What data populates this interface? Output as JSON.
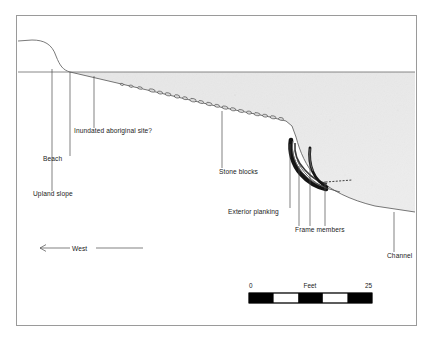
{
  "figure": {
    "type": "archaeological-cross-section",
    "title_text": "",
    "border": {
      "x": 16,
      "y": 15,
      "width": 401,
      "height": 311,
      "color": "#9a9a9a"
    }
  },
  "annotations": [
    {
      "id": "upland-slope",
      "label": "Upland slope",
      "text_x": 33,
      "text_y": 196,
      "leader": {
        "x1": 52,
        "y1": 191,
        "x2": 52,
        "y2": 69
      }
    },
    {
      "id": "beach",
      "label": "Beach",
      "text_x": 43,
      "text_y": 161,
      "leader": {
        "x1": 70,
        "y1": 156,
        "x2": 70,
        "y2": 72
      }
    },
    {
      "id": "inundated-aboriginal-site",
      "label": "Inundated aboriginal site?",
      "text_x": 74,
      "text_y": 133,
      "leader": {
        "x1": 94,
        "y1": 128,
        "x2": 94,
        "y2": 76
      }
    },
    {
      "id": "stone-blocks",
      "label": "Stone blocks",
      "text_x": 219,
      "text_y": 174,
      "leader": {
        "x1": 222,
        "y1": 168,
        "x2": 222,
        "y2": 111
      }
    },
    {
      "id": "exterior-planking",
      "label": "Exterior planking",
      "text_x": 228,
      "text_y": 214,
      "leader": {
        "x1": 290,
        "y1": 208,
        "x2": 290,
        "y2": 144
      }
    },
    {
      "id": "frame-members",
      "label": "Frame members",
      "text_x": 295,
      "text_y": 232,
      "leaders": [
        {
          "x1": 299,
          "y1": 226,
          "x2": 299,
          "y2": 166
        },
        {
          "x1": 310,
          "y1": 226,
          "x2": 310,
          "y2": 148
        },
        {
          "x1": 325,
          "y1": 226,
          "x2": 325,
          "y2": 181
        }
      ]
    },
    {
      "id": "channel",
      "label": "Channel",
      "text_x": 387,
      "text_y": 258,
      "leader": {
        "x1": 394,
        "y1": 252,
        "x2": 394,
        "y2": 212
      }
    }
  ],
  "direction_indicator": {
    "label": "West",
    "text_x": 77,
    "text_y": 251,
    "arrow": {
      "x1": 40,
      "y1": 248,
      "x2": 143,
      "y2": 248
    }
  },
  "scale_bar": {
    "label": "Feet",
    "min_label": "0",
    "max_label": "25",
    "x": 249,
    "y": 293,
    "width": 123,
    "height": 10,
    "segments": 5,
    "segment_fills": [
      "#000000",
      "#ffffff",
      "#000000",
      "#ffffff",
      "#000000"
    ],
    "label_y": 288,
    "label_x": 310
  },
  "colors": {
    "line": "#555555",
    "text": "#1a1a1a",
    "sediment_light": "#f2f2f2",
    "sediment_mid": "#e6e6e6",
    "wreck_dark": "#111111",
    "border": "#9a9a9a",
    "water_line": "#6b6b6b"
  },
  "geometry": {
    "waterline_y": 72,
    "waterline_x1": 18,
    "waterline_x2": 415,
    "upland_profile": "M18,41 L32,40 C44,40 52,44 56,56 C60,66 63,70 70,72",
    "seabed_profile": "M70,72 L100,79 L160,93 L220,107 L270,117 L286,121 L292,126 L296,137 C300,152 306,166 316,177 C330,190 350,200 375,206 L415,212",
    "sediment_fill": "M70,72 L100,79 L160,93 L220,107 L270,117 L286,121 L292,126 L296,137 C300,152 306,166 316,177 C330,190 350,200 375,206 L415,212 L415,72 Z"
  }
}
